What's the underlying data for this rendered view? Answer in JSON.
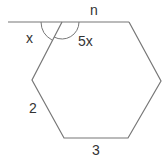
{
  "diagram": {
    "type": "hexagon-with-exterior-line",
    "labels": {
      "line": "n",
      "exterior_angle": "x",
      "interior_angle": "5x",
      "left_side": "2",
      "bottom_side": "3"
    },
    "colors": {
      "stroke": "#777777",
      "text": "#333333",
      "background": "#ffffff"
    }
  }
}
